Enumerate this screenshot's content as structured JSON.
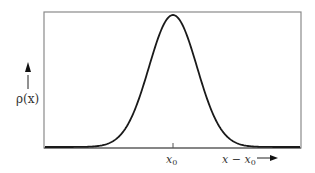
{
  "chart_data": {
    "type": "line",
    "title": "",
    "xlabel": "x − x0",
    "ylabel": "ρ(x)",
    "x_tick_labels": [
      "x0"
    ],
    "series": [
      {
        "name": "Gaussian ρ(x)",
        "shape": "bell curve centered at x0"
      }
    ],
    "grid": false,
    "legend": null,
    "colors": {
      "curve": "#1a1a1a",
      "frame": "#8a8a8a",
      "text": "#333333"
    }
  },
  "labels": {
    "y_axis": "ρ(x)",
    "x_tick_main": "x",
    "x_tick_sub": "0",
    "x_axis_main": "x − x",
    "x_axis_sub": "0"
  }
}
